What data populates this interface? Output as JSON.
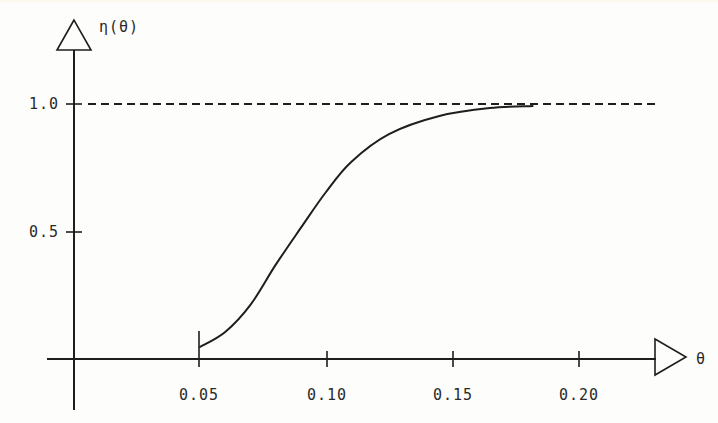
{
  "chart_data": {
    "type": "line",
    "title": "",
    "xlabel": "θ",
    "ylabel": "η(θ)",
    "xlim": [
      0,
      0.24
    ],
    "ylim": [
      0,
      1.2
    ],
    "grid": false,
    "legend": null,
    "x_ticks": [
      {
        "value": 0.05,
        "label": "0.05"
      },
      {
        "value": 0.1,
        "label": "0.10"
      },
      {
        "value": 0.15,
        "label": "0.15"
      },
      {
        "value": 0.2,
        "label": "0.20"
      }
    ],
    "y_ticks": [
      {
        "value": 0.5,
        "label": "0.5"
      },
      {
        "value": 1.0,
        "label": "1.0"
      }
    ],
    "reference_lines": [
      {
        "orientation": "horizontal",
        "y": 1.0,
        "style": "dashed"
      }
    ],
    "series": [
      {
        "name": "η(θ)",
        "style": "solid",
        "x": [
          0.05,
          0.06,
          0.07,
          0.08,
          0.09,
          0.1,
          0.11,
          0.125,
          0.145,
          0.165,
          0.182
        ],
        "y": [
          0.047,
          0.106,
          0.212,
          0.369,
          0.514,
          0.655,
          0.773,
          0.882,
          0.953,
          0.984,
          0.992
        ]
      }
    ],
    "annotations": [
      {
        "type": "vertical-tick",
        "x": 0.05,
        "y_from": 0,
        "y_to": 0.11
      }
    ]
  },
  "labels": {
    "y_axis": "η(θ)",
    "x_axis": "θ",
    "y_tick_1": "1.0",
    "y_tick_05": "0.5",
    "x_tick_005": "0.05",
    "x_tick_010": "0.10",
    "x_tick_015": "0.15",
    "x_tick_020": "0.20"
  },
  "colors": {
    "ink": "#1e1e1e",
    "background": "#fdfdfb"
  }
}
